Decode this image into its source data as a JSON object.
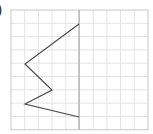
{
  "label": ")",
  "grid": {
    "x0": 11,
    "y0": 10,
    "cols": 10,
    "rows": 9,
    "cell_w": 13.7,
    "cell_h": 13.3,
    "line_color": "#e3e3e3",
    "border_color": "#c8c8c8"
  },
  "mirror_line": {
    "x": 79,
    "color": "#9a9a9a"
  },
  "shape": {
    "color": "#4a4a4a",
    "points": [
      [
        79,
        24
      ],
      [
        25,
        64
      ],
      [
        52,
        90
      ],
      [
        25,
        104
      ],
      [
        79,
        117
      ]
    ]
  }
}
